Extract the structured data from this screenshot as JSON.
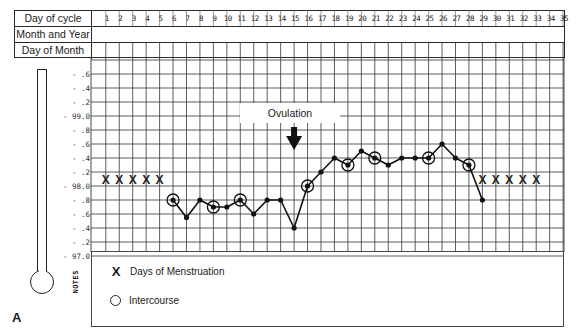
{
  "header": {
    "row_labels": [
      "Day of cycle",
      "Month and Year",
      "Day of Month"
    ],
    "days": [
      "1",
      "2",
      "3",
      "4",
      "5",
      "6",
      "7",
      "8",
      "9",
      "10",
      "11",
      "12",
      "13",
      "14",
      "15",
      "16",
      "17",
      "18",
      "19",
      "20",
      "21",
      "22",
      "23",
      "24",
      "25",
      "26",
      "27",
      "28",
      "29",
      "30",
      "31",
      "32",
      "33",
      "34",
      "35"
    ]
  },
  "y_axis": {
    "labels": [
      ".6",
      ".4",
      ".2",
      "-99.0",
      ".8",
      ".6",
      ".4",
      ".2",
      "-98.0",
      ".8",
      ".6",
      ".4",
      ".2",
      "-97.0"
    ]
  },
  "annotation": {
    "ovulation": "Ovulation"
  },
  "notes": {
    "label": "NOTES",
    "legend": [
      {
        "symbol": "X",
        "label": "Days of Menstruation"
      },
      {
        "symbol": "O",
        "label": "Intercourse"
      }
    ]
  },
  "figure_label": "A",
  "chart_data": {
    "type": "line",
    "xlabel": "Day of cycle",
    "ylabel": "Temperature (°F)",
    "ylim": [
      97.0,
      99.6
    ],
    "grid": true,
    "x": [
      6,
      7,
      8,
      9,
      10,
      11,
      12,
      13,
      14,
      15,
      16,
      17,
      18,
      19,
      20,
      21,
      22,
      23,
      24,
      25,
      26,
      27,
      28,
      29
    ],
    "values": [
      97.8,
      97.55,
      97.8,
      97.7,
      97.7,
      97.8,
      97.6,
      97.8,
      97.8,
      97.4,
      98.0,
      98.2,
      98.4,
      98.3,
      98.5,
      98.4,
      98.3,
      98.4,
      98.4,
      98.4,
      98.6,
      98.4,
      98.3,
      97.8
    ],
    "menstruation_days": [
      1,
      2,
      3,
      4,
      5,
      29,
      30,
      31,
      32,
      33
    ],
    "menstruation_marker_temp": 98.1,
    "intercourse_days": [
      6,
      9,
      11,
      16,
      19,
      21,
      25,
      28
    ],
    "ovulation_day": 15,
    "annotations": [
      "Ovulation"
    ],
    "legend": [
      "X Days of Menstruation",
      "O Intercourse"
    ]
  }
}
